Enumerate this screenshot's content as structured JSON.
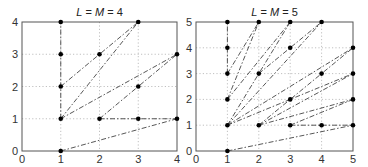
{
  "chart_data": [
    {
      "type": "line",
      "title": "L = M = 4",
      "title_parts": [
        {
          "t": "L",
          "italic": true
        },
        {
          "t": " = ",
          "italic": false
        },
        {
          "t": "M",
          "italic": true
        },
        {
          "t": " = 4",
          "italic": false
        }
      ],
      "xlabel": "",
      "ylabel": "",
      "xlim": [
        0,
        4
      ],
      "ylim": [
        0,
        4
      ],
      "xticks": [
        0,
        1,
        2,
        3,
        4
      ],
      "yticks": [
        0,
        1,
        2,
        3,
        4
      ],
      "grid": "dotted",
      "points": [
        [
          1,
          0
        ],
        [
          1,
          1
        ],
        [
          1,
          2
        ],
        [
          1,
          3
        ],
        [
          1,
          4
        ],
        [
          2,
          1
        ],
        [
          2,
          3
        ],
        [
          3,
          1
        ],
        [
          3,
          2
        ],
        [
          3,
          4
        ],
        [
          4,
          1
        ],
        [
          4,
          3
        ]
      ],
      "segments": [
        [
          [
            1,
            1
          ],
          [
            1,
            4
          ]
        ],
        [
          [
            1,
            2
          ],
          [
            3,
            4
          ]
        ],
        [
          [
            1,
            1
          ],
          [
            3,
            4
          ]
        ],
        [
          [
            1,
            1
          ],
          [
            4,
            3
          ]
        ],
        [
          [
            2,
            1
          ],
          [
            4,
            3
          ]
        ],
        [
          [
            2,
            1
          ],
          [
            4,
            1
          ]
        ],
        [
          [
            1,
            0
          ],
          [
            4,
            1
          ]
        ]
      ],
      "box": {
        "x0": 22,
        "y0": 22,
        "x1": 177,
        "y1": 151
      }
    },
    {
      "type": "line",
      "title": "L = M = 5",
      "title_parts": [
        {
          "t": "L",
          "italic": true
        },
        {
          "t": " = ",
          "italic": false
        },
        {
          "t": "M",
          "italic": true
        },
        {
          "t": " = 5",
          "italic": false
        }
      ],
      "xlabel": "",
      "ylabel": "",
      "xlim": [
        0,
        5
      ],
      "ylim": [
        0,
        5
      ],
      "xticks": [
        0,
        1,
        2,
        3,
        4,
        5
      ],
      "yticks": [
        0,
        1,
        2,
        3,
        4,
        5
      ],
      "grid": "dotted",
      "points": [
        [
          1,
          0
        ],
        [
          1,
          1
        ],
        [
          1,
          2
        ],
        [
          1,
          3
        ],
        [
          1,
          4
        ],
        [
          1,
          5
        ],
        [
          2,
          1
        ],
        [
          2,
          3
        ],
        [
          2,
          5
        ],
        [
          3,
          1
        ],
        [
          3,
          2
        ],
        [
          3,
          4
        ],
        [
          3,
          5
        ],
        [
          4,
          1
        ],
        [
          4,
          3
        ],
        [
          4,
          5
        ],
        [
          5,
          1
        ],
        [
          5,
          2
        ],
        [
          5,
          3
        ],
        [
          5,
          4
        ]
      ],
      "segments": [
        [
          [
            1,
            3
          ],
          [
            1,
            5
          ]
        ],
        [
          [
            1,
            2
          ],
          [
            2,
            5
          ]
        ],
        [
          [
            1,
            3
          ],
          [
            2,
            5
          ]
        ],
        [
          [
            1,
            1
          ],
          [
            3,
            5
          ]
        ],
        [
          [
            1,
            2
          ],
          [
            3,
            5
          ]
        ],
        [
          [
            1,
            1
          ],
          [
            4,
            5
          ]
        ],
        [
          [
            2,
            3
          ],
          [
            4,
            5
          ]
        ],
        [
          [
            1,
            1
          ],
          [
            5,
            4
          ]
        ],
        [
          [
            2,
            1
          ],
          [
            5,
            4
          ]
        ],
        [
          [
            1,
            1
          ],
          [
            5,
            3
          ]
        ],
        [
          [
            2,
            1
          ],
          [
            5,
            3
          ]
        ],
        [
          [
            2,
            1
          ],
          [
            5,
            2
          ]
        ],
        [
          [
            3,
            1
          ],
          [
            5,
            2
          ]
        ],
        [
          [
            3,
            1
          ],
          [
            5,
            1
          ]
        ],
        [
          [
            1,
            0
          ],
          [
            5,
            1
          ]
        ]
      ],
      "box": {
        "x0": 196,
        "y0": 22,
        "x1": 353,
        "y1": 151
      }
    }
  ],
  "colors": {
    "axis": "#555555",
    "grid": "#b0b0b0",
    "line": "#444444",
    "marker": "#000000"
  }
}
